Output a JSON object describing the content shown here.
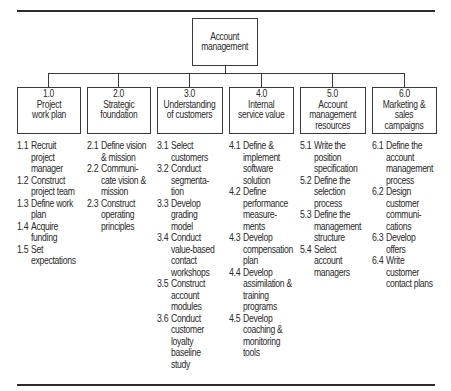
{
  "diagram": {
    "root": {
      "label": "Account\nmanagement"
    },
    "branches": [
      {
        "number": "1.0",
        "title": "Project\nwork plan",
        "items": [
          {
            "num": "1.1",
            "text": "Recruit\nproject\nmanager"
          },
          {
            "num": "1.2",
            "text": "Construct\nproject team"
          },
          {
            "num": "1.3",
            "text": "Define work\nplan"
          },
          {
            "num": "1.4",
            "text": "Acquire\nfunding"
          },
          {
            "num": "1.5",
            "text": "Set\nexpectations"
          }
        ]
      },
      {
        "number": "2.0",
        "title": "Strategic\nfoundation",
        "items": [
          {
            "num": "2.1",
            "text": "Define vision\n& mission"
          },
          {
            "num": "2.2",
            "text": "Communi-\ncate vision &\nmission"
          },
          {
            "num": "2.3",
            "text": "Construct\noperating\nprinciples"
          }
        ]
      },
      {
        "number": "3.0",
        "title": "Understanding\nof customers",
        "items": [
          {
            "num": "3.1",
            "text": "Select\ncustomers"
          },
          {
            "num": "3.2",
            "text": "Conduct\nsegmenta-\ntion"
          },
          {
            "num": "3.3",
            "text": "Develop\ngrading\nmodel"
          },
          {
            "num": "3.4",
            "text": "Conduct\nvalue-based\ncontact\nworkshops"
          },
          {
            "num": "3.5",
            "text": "Construct\naccount\nmodules"
          },
          {
            "num": "3.6",
            "text": "Conduct\ncustomer\nloyalty\nbaseline\nstudy"
          }
        ]
      },
      {
        "number": "4.0",
        "title": "Internal\nservice value",
        "items": [
          {
            "num": "4.1",
            "text": "Define &\nimplement\nsoftware\nsolution"
          },
          {
            "num": "4.2",
            "text": "Define\nperformance\nmeasure-\nments"
          },
          {
            "num": "4.3",
            "text": "Develop\ncompensation\nplan"
          },
          {
            "num": "4.4",
            "text": "Develop\nassimilation &\ntraining\nprograms"
          },
          {
            "num": "4.5",
            "text": "Develop\ncoaching &\nmonitoring\ntools"
          }
        ]
      },
      {
        "number": "5.0",
        "title": "Account\nmanagement\nresources",
        "items": [
          {
            "num": "5.1",
            "text": "Write the\nposition\nspecification"
          },
          {
            "num": "5.2",
            "text": "Define the\nselection\nprocess"
          },
          {
            "num": "5.3",
            "text": "Define the\nmanagement\nstructure"
          },
          {
            "num": "5.4",
            "text": "Select\naccount\nmanagers"
          }
        ]
      },
      {
        "number": "6.0",
        "title": "Marketing &\nsales\ncampaigns",
        "items": [
          {
            "num": "6.1",
            "text": "Define the\naccount\nmanagement\nprocess"
          },
          {
            "num": "6.2",
            "text": "Design\ncustomer\ncommuni-\ncations"
          },
          {
            "num": "6.3",
            "text": "Develop\noffers"
          },
          {
            "num": "6.4",
            "text": "Write\ncustomer\ncontact plans"
          }
        ]
      }
    ]
  },
  "colors": {
    "line": "#3a3a3a",
    "text": "#2a2a2a",
    "background": "#ffffff"
  }
}
